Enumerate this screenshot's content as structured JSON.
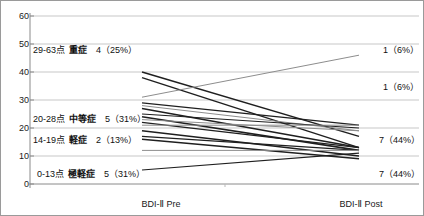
{
  "chart_data": {
    "type": "line",
    "title": "",
    "xlabel": "",
    "ylabel": "",
    "categories": [
      "BDI-Ⅱ Pre",
      "BDI-Ⅱ Post"
    ],
    "x": [
      0,
      1
    ],
    "ylim": [
      0,
      60
    ],
    "yticks": [
      0,
      10,
      20,
      30,
      40,
      50,
      60
    ],
    "ytick_labels": [
      "0",
      "10",
      "20",
      "30",
      "40",
      "50",
      "60"
    ],
    "grid": true,
    "legend": "none",
    "series": [
      {
        "name": "subject-1",
        "values": [
          40,
          17
        ]
      },
      {
        "name": "subject-2",
        "values": [
          38,
          13
        ]
      },
      {
        "name": "subject-3",
        "values": [
          31,
          46
        ]
      },
      {
        "name": "subject-4",
        "values": [
          29,
          21
        ]
      },
      {
        "name": "subject-5",
        "values": [
          28,
          19
        ]
      },
      {
        "name": "subject-6",
        "values": [
          27,
          13
        ]
      },
      {
        "name": "subject-7",
        "values": [
          25,
          20
        ]
      },
      {
        "name": "subject-8",
        "values": [
          24,
          12
        ]
      },
      {
        "name": "subject-9",
        "values": [
          23,
          19
        ]
      },
      {
        "name": "subject-10",
        "values": [
          22,
          13
        ]
      },
      {
        "name": "subject-11",
        "values": [
          21,
          21
        ]
      },
      {
        "name": "subject-12",
        "values": [
          19,
          10
        ]
      },
      {
        "name": "subject-13",
        "values": [
          17,
          12
        ]
      },
      {
        "name": "subject-14",
        "values": [
          16,
          9
        ]
      },
      {
        "name": "subject-15",
        "values": [
          12,
          12
        ]
      },
      {
        "name": "subject-16",
        "values": [
          5,
          11
        ]
      }
    ]
  },
  "axis": {
    "y_ticks": [
      "60",
      "50",
      "40",
      "30",
      "20",
      "10",
      "0"
    ],
    "x_categories": [
      "BDI-Ⅱ Pre",
      "BDI-Ⅱ Post"
    ]
  },
  "severity_bands": [
    {
      "range": "29-63点",
      "name": "重症",
      "count": "4（25%）"
    },
    {
      "range": "20-28点",
      "name": "中等症",
      "count": "5（31%）"
    },
    {
      "range": "14-19点",
      "name": "軽症",
      "count": "2（13%）"
    },
    {
      "range": "0-13点",
      "name": "極軽症",
      "count": "5（31%）"
    }
  ],
  "post_counts": [
    {
      "label": "1（6%）"
    },
    {
      "label": "1（6%）"
    },
    {
      "label": "7（44%）"
    },
    {
      "label": "7（44%）"
    }
  ],
  "colors": {
    "line_dark": "#1f1f1f",
    "line_grey": "#8d8d8d",
    "grid": "#b9b9b9",
    "axis": "#8a8a8a",
    "border": "#9a9a9a",
    "text": "#111111"
  }
}
